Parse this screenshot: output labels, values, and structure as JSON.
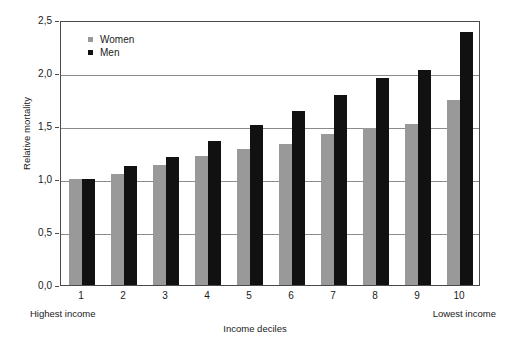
{
  "chart_data": {
    "type": "bar",
    "title": "",
    "xlabel": "Income deciles",
    "ylabel": "Relative mortality",
    "categories": [
      "1",
      "2",
      "3",
      "4",
      "5",
      "6",
      "7",
      "8",
      "9",
      "10"
    ],
    "series": [
      {
        "name": "Women",
        "color": "#999999",
        "values": [
          1.0,
          1.05,
          1.13,
          1.22,
          1.28,
          1.33,
          1.42,
          1.48,
          1.52,
          1.75
        ]
      },
      {
        "name": "Men",
        "color": "#111111",
        "values": [
          1.0,
          1.12,
          1.21,
          1.36,
          1.51,
          1.64,
          1.79,
          1.95,
          2.03,
          2.39
        ]
      }
    ],
    "ylim": [
      0.0,
      2.5
    ],
    "ytick_values": [
      0.0,
      0.5,
      1.0,
      1.5,
      2.0,
      2.5
    ],
    "ytick_labels": [
      "0,0",
      "0,5",
      "1,0",
      "1,5",
      "2,0",
      "2,5"
    ],
    "grid": true,
    "legend_position": "top-left",
    "annotations": {
      "left_axis_end": "Highest income",
      "right_axis_end": "Lowest income"
    }
  }
}
